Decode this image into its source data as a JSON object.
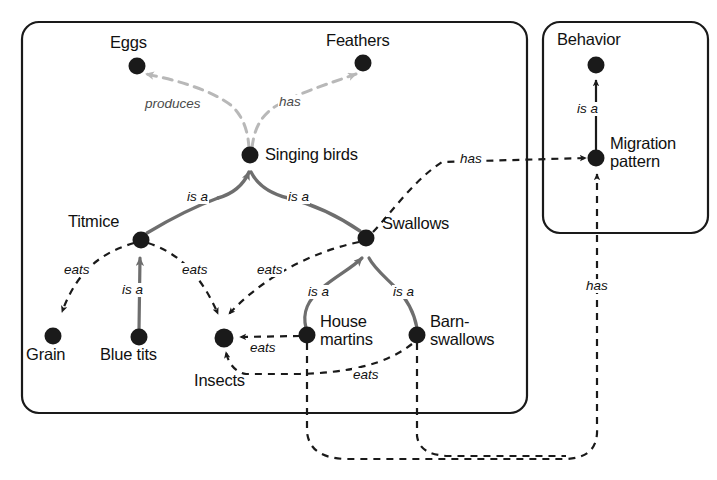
{
  "diagram": {
    "type": "concept-map",
    "title_visible": false,
    "colors": {
      "stroke_dark": "#1a1a1a",
      "stroke_gray": "#6e6e6e",
      "stroke_light": "#b8b8b8",
      "background": "#ffffff"
    },
    "containers": [
      {
        "id": "birds-box",
        "label": "",
        "x": 22,
        "y": 22,
        "width": 505,
        "height": 391
      },
      {
        "id": "behavior-box",
        "label": "",
        "x": 543,
        "y": 22,
        "width": 165,
        "height": 211
      }
    ],
    "nodes": [
      {
        "id": "eggs",
        "label": "Eggs",
        "x": 137,
        "y": 66,
        "label_x": 110,
        "label_y": 33,
        "align": "left"
      },
      {
        "id": "feathers",
        "label": "Feathers",
        "x": 363,
        "y": 63,
        "label_x": 326,
        "label_y": 31,
        "align": "left"
      },
      {
        "id": "singing",
        "label": "Singing birds",
        "x": 250,
        "y": 155,
        "label_x": 265,
        "label_y": 145,
        "align": "left"
      },
      {
        "id": "titmice",
        "label": "Titmice",
        "x": 141,
        "y": 240,
        "label_x": 68,
        "label_y": 212,
        "align": "left"
      },
      {
        "id": "swallows",
        "label": "Swallows",
        "x": 366,
        "y": 238,
        "label_x": 382,
        "label_y": 214,
        "align": "left"
      },
      {
        "id": "grain",
        "label": "Grain",
        "x": 53,
        "y": 336,
        "label_x": 26,
        "label_y": 345,
        "align": "left"
      },
      {
        "id": "bluetits",
        "label": "Blue tits",
        "x": 139,
        "y": 337,
        "label_x": 100,
        "label_y": 345,
        "align": "left"
      },
      {
        "id": "insects",
        "label": "Insects",
        "x": 224,
        "y": 338,
        "label_x": 194,
        "label_y": 371,
        "align": "left"
      },
      {
        "id": "housemartins",
        "label": "House\nmartins",
        "x": 307,
        "y": 335,
        "label_x": 320,
        "label_y": 312,
        "align": "left"
      },
      {
        "id": "barnswallows",
        "label": "Barn-\nswallows",
        "x": 417,
        "y": 335,
        "label_x": 430,
        "label_y": 312,
        "align": "left"
      },
      {
        "id": "behavior",
        "label": "Behavior",
        "x": 596,
        "y": 65,
        "label_x": 557,
        "label_y": 30,
        "align": "left"
      },
      {
        "id": "migration",
        "label": "Migration\npattern",
        "x": 596,
        "y": 158,
        "label_x": 610,
        "label_y": 134,
        "align": "left"
      }
    ],
    "edges": [
      {
        "id": "e1",
        "from": "singing",
        "to": "eggs",
        "label": "produces",
        "style": "light",
        "label_x": 144,
        "label_y": 97
      },
      {
        "id": "e2",
        "from": "singing",
        "to": "feathers",
        "label": "has",
        "style": "light",
        "label_x": 278,
        "label_y": 95
      },
      {
        "id": "e3",
        "from": "titmice",
        "to": "singing",
        "label": "is a",
        "style": "gray",
        "label_x": 186,
        "label_y": 190
      },
      {
        "id": "e4",
        "from": "swallows",
        "to": "singing",
        "label": "is a",
        "style": "gray",
        "label_x": 287,
        "label_y": 190
      },
      {
        "id": "e5",
        "from": "titmice",
        "to": "grain",
        "label": "eats",
        "style": "dashed",
        "label_x": 63,
        "label_y": 263
      },
      {
        "id": "e6",
        "from": "bluetits",
        "to": "titmice",
        "label": "is a",
        "style": "gray",
        "label_x": 121,
        "label_y": 283
      },
      {
        "id": "e7",
        "from": "titmice",
        "to": "insects",
        "label": "eats",
        "style": "dashed",
        "label_x": 181,
        "label_y": 263
      },
      {
        "id": "e8",
        "from": "swallows",
        "to": "insects",
        "label": "eats",
        "style": "dashed",
        "label_x": 256,
        "label_y": 263
      },
      {
        "id": "e9",
        "from": "housemartins",
        "to": "swallows",
        "label": "is a",
        "style": "gray",
        "label_x": 307,
        "label_y": 285
      },
      {
        "id": "e10",
        "from": "barnswallows",
        "to": "swallows",
        "label": "is a",
        "style": "gray",
        "label_x": 392,
        "label_y": 285
      },
      {
        "id": "e11",
        "from": "housemartins",
        "to": "insects",
        "label": "eats",
        "style": "dashed",
        "label_x": 249,
        "label_y": 341
      },
      {
        "id": "e12",
        "from": "barnswallows",
        "to": "insects",
        "label": "eats",
        "style": "dashed",
        "label_x": 352,
        "label_y": 371
      },
      {
        "id": "e13",
        "from": "swallows",
        "to": "migration",
        "label": "has",
        "style": "dashed",
        "label_x": 459,
        "label_y": 153
      },
      {
        "id": "e14",
        "from": "migration",
        "to": "behavior",
        "label": "is a",
        "style": "dark",
        "label_x": 576,
        "label_y": 103
      },
      {
        "id": "e15",
        "from": "housemartins",
        "to": "migration",
        "label": "has",
        "style": "dashed",
        "label_x": 585,
        "label_y": 280
      },
      {
        "id": "e16",
        "from": "barnswallows",
        "to": "migration",
        "label": "",
        "style": "dashed",
        "label_x": 0,
        "label_y": 0
      }
    ]
  }
}
